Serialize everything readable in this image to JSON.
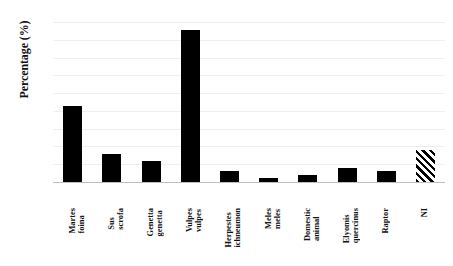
{
  "chart_data": {
    "type": "bar",
    "title": "",
    "xlabel": "",
    "ylabel": "Percentage (%)",
    "ylim": [
      0,
      45
    ],
    "ytick_step": 5,
    "yticks": [
      0,
      5,
      10,
      15,
      20,
      25,
      30,
      35,
      40,
      45
    ],
    "grid": true,
    "legend": "none",
    "categories": [
      "Martes foina",
      "Sus scrofa",
      "Genetta genetta",
      "Vulpes vulpes",
      "Herpestes\nichneumon",
      "Meles meles",
      "Domestic\nanimal",
      "Elyomis\nquercinus",
      "Raptor",
      "NI"
    ],
    "values": [
      21.4,
      8.0,
      6.0,
      42.8,
      3.0,
      1.0,
      2.0,
      4.0,
      3.0,
      9.0
    ],
    "bar_styles": [
      "solid",
      "solid",
      "solid",
      "solid",
      "solid",
      "solid",
      "solid",
      "solid",
      "solid",
      "hatched"
    ],
    "bar_color": "#000000",
    "grid_color": "#eceff3",
    "axis_color": "#b9bfc6"
  }
}
